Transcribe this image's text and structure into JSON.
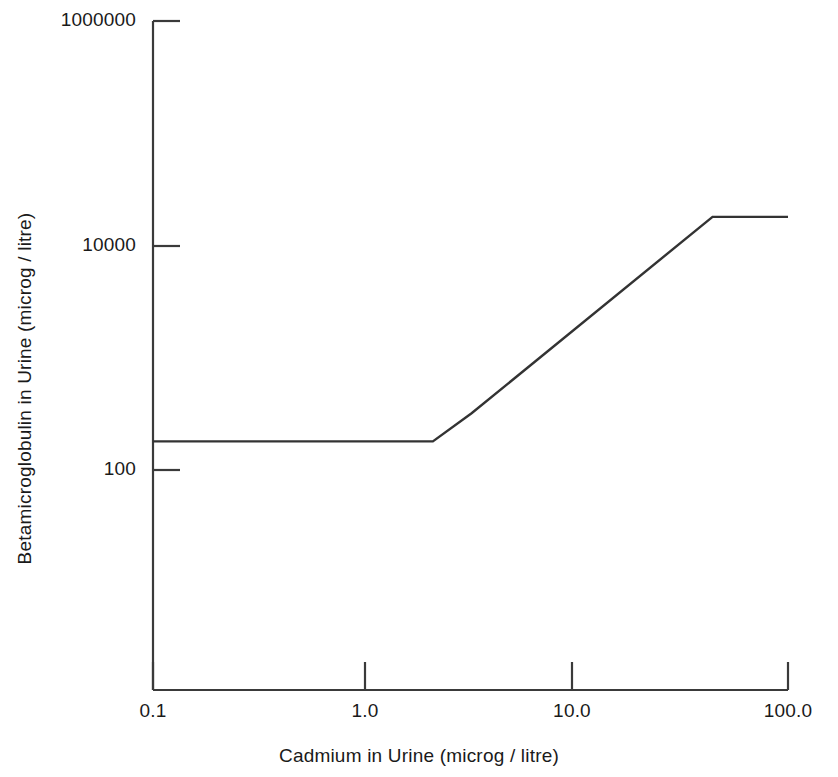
{
  "chart_data": {
    "type": "line",
    "title": "",
    "xlabel": "Cadmium in Urine (microg / litre)",
    "ylabel": "Betamicroglobulin in Urine (microg / litre)",
    "xscale": "log",
    "yscale": "log",
    "xlim": [
      0.1,
      100.0
    ],
    "ylim": [
      100,
      1000000
    ],
    "grid": false,
    "legend": null,
    "xticks": [
      {
        "value": 0.1,
        "label": "0.1"
      },
      {
        "value": 1.0,
        "label": "1.0"
      },
      {
        "value": 10.0,
        "label": "10.0"
      },
      {
        "value": 100.0,
        "label": "100.0"
      }
    ],
    "yticks": [
      {
        "value": 100,
        "label": "100"
      },
      {
        "value": 10000,
        "label": "10000"
      },
      {
        "value": 1000000,
        "label": "1000000"
      }
    ],
    "series": [
      {
        "name": "Betamicroglobulin response",
        "color": "#333333",
        "x": [
          0.1,
          2.1,
          3.2,
          44.0,
          100.0
        ],
        "y": [
          180,
          180,
          320,
          18000,
          18000
        ]
      }
    ]
  },
  "axes": {
    "x_title": "Cadmium in Urine (microg / litre)",
    "y_title": "Betamicroglobulin in Urine (microg / litre)",
    "x_tick_labels": [
      "0.1",
      "1.0",
      "10.0",
      "100.0"
    ],
    "y_tick_labels": [
      "1000000",
      "10000",
      "100"
    ],
    "axis_color": "#3a3a3a",
    "line_color": "#333333"
  }
}
